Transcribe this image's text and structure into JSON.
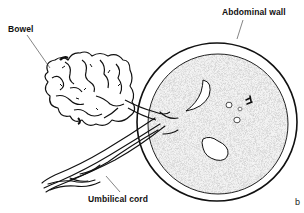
{
  "diagram": {
    "labels": {
      "bowel": "Bowel",
      "abdominal_wall": "Abdominal wall",
      "umbilical_cord": "Umbilical cord"
    },
    "panel_letter": "b",
    "colors": {
      "line": "#111111",
      "abdomen_fill": "#8a8a8a",
      "background": "#ffffff"
    }
  }
}
